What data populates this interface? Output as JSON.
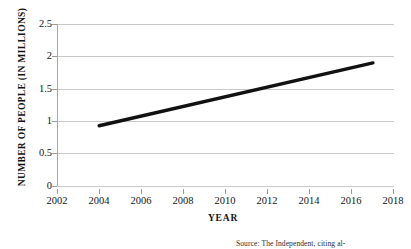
{
  "chart_data": {
    "type": "line",
    "title": "",
    "xlabel": "YEAR",
    "ylabel": "NUMBER OF PEOPLE (IN MILLIONS)",
    "xlim": [
      2002,
      2018
    ],
    "ylim": [
      0,
      2.5
    ],
    "grid": true,
    "legend": "none",
    "xticks": [
      2002,
      2004,
      2006,
      2008,
      2010,
      2012,
      2014,
      2016,
      2018
    ],
    "xtick_labels": [
      "2002",
      "2004",
      "2006",
      "2008",
      "2010",
      "2012",
      "2014",
      "2016",
      "2018"
    ],
    "yticks": [
      0,
      0.5,
      1,
      1.5,
      2,
      2.5
    ],
    "ytick_labels": [
      "0",
      "0.5",
      "1",
      "1.5",
      "2",
      "2.5"
    ],
    "series": [
      {
        "name": "Number of people",
        "color": "#111111",
        "line_width": 3.4,
        "x": [
          2004,
          2017
        ],
        "values": [
          0.93,
          1.9
        ]
      }
    ]
  },
  "annotations": {
    "source_note": "Source: The Independent, citing al-"
  }
}
